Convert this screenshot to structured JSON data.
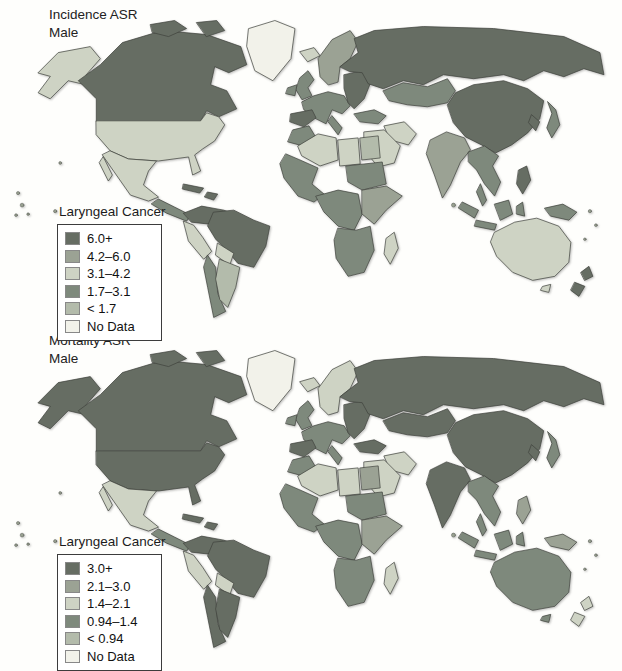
{
  "figure": {
    "map_style": {
      "border_color": "#3f423c",
      "ocean_color": "#ffffff"
    },
    "maps": [
      {
        "id": "incidence",
        "title_line1": "Incidence ASR",
        "title_line2": "Male",
        "legend_title": "Laryngeal Cancer",
        "legend": [
          {
            "label": "6.0+",
            "color": "#666d63"
          },
          {
            "label": "4.2–6.0",
            "color": "#9ba294"
          },
          {
            "label": "3.1–4.2",
            "color": "#ced3c4"
          },
          {
            "label": "1.7–3.1",
            "color": "#7e897c"
          },
          {
            "label": "< 1.7",
            "color": "#b3bbab"
          },
          {
            "label": "No Data",
            "color": "#f2f2ea"
          }
        ],
        "regions": {
          "alaska": 2,
          "canada": 0,
          "greenland": 5,
          "usa": 2,
          "mexico": 2,
          "camerica": 3,
          "cuba": 0,
          "colven": 0,
          "peru": 2,
          "brazil": 0,
          "bolivia": 2,
          "chile": 3,
          "argentina": 4,
          "iceland": 2,
          "uk": 3,
          "scandinavia": 1,
          "weurope": 3,
          "eeurope": 0,
          "spain": 0,
          "russia": 0,
          "kazakh": 3,
          "mongolia": 2,
          "china": 0,
          "japan": 3,
          "india": 1,
          "turkey": 3,
          "iran": 2,
          "saudi": 2,
          "morocco": 3,
          "algeria": 2,
          "libya": 2,
          "egypt": 4,
          "sudan": 3,
          "wafrica": 3,
          "cafrica": 3,
          "eafrica": 1,
          "safrica": 3,
          "madagascar": 2,
          "seasia": 3,
          "indonesia": 3,
          "philippines": 0,
          "png": 3,
          "australia": 2,
          "nz": 0
        }
      },
      {
        "id": "mortality",
        "title_line1": "Mortality ASR",
        "title_line2": "Male",
        "legend_title": "Laryngeal Cancer",
        "legend": [
          {
            "label": "3.0+",
            "color": "#666d63"
          },
          {
            "label": "2.1–3.0",
            "color": "#9ba294"
          },
          {
            "label": "1.4–2.1",
            "color": "#ced3c4"
          },
          {
            "label": "0.94–1.4",
            "color": "#7e897c"
          },
          {
            "label": "< 0.94",
            "color": "#b3bbab"
          },
          {
            "label": "No Data",
            "color": "#f2f2ea"
          }
        ],
        "regions": {
          "alaska": 0,
          "canada": 0,
          "greenland": 5,
          "usa": 0,
          "mexico": 2,
          "camerica": 3,
          "cuba": 0,
          "colven": 0,
          "peru": 2,
          "brazil": 0,
          "bolivia": 2,
          "chile": 0,
          "argentina": 0,
          "iceland": 2,
          "uk": 3,
          "scandinavia": 2,
          "weurope": 3,
          "eeurope": 0,
          "spain": 0,
          "russia": 0,
          "kazakh": 0,
          "mongolia": 2,
          "china": 0,
          "japan": 3,
          "india": 0,
          "turkey": 0,
          "iran": 2,
          "saudi": 2,
          "morocco": 3,
          "algeria": 2,
          "libya": 2,
          "egypt": 1,
          "sudan": 3,
          "wafrica": 3,
          "cafrica": 3,
          "eafrica": 1,
          "safrica": 3,
          "madagascar": 2,
          "seasia": 3,
          "indonesia": 3,
          "philippines": 1,
          "png": 1,
          "australia": 3,
          "nz": 2
        }
      }
    ]
  }
}
